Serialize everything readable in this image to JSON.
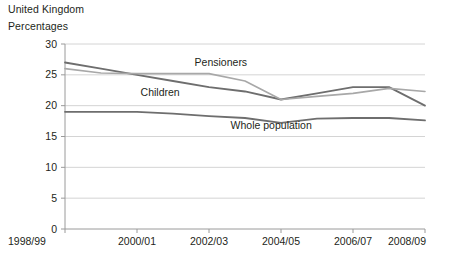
{
  "header": {
    "country": "United Kingdom",
    "units": "Percentages"
  },
  "chart_data": {
    "type": "line",
    "title": "United Kingdom",
    "subtitle": "Percentages",
    "xlabel": "",
    "ylabel": "Percentages",
    "ylim": [
      0,
      30
    ],
    "yticks": [
      0,
      5,
      10,
      15,
      20,
      25,
      30
    ],
    "ytick_labels": [
      "0",
      "5",
      "10",
      "15",
      "20",
      "25",
      "30"
    ],
    "grid": true,
    "grid_axis": "y",
    "legend_position": "inline-labels",
    "x": [
      "1998/99",
      "1999/00",
      "2000/01",
      "2001/02",
      "2002/03",
      "2003/04",
      "2004/05",
      "2005/06",
      "2006/07",
      "2007/08",
      "2008/09"
    ],
    "xtick_labels": [
      "1998/99",
      "2000/01",
      "2002/03",
      "2004/05",
      "2006/07",
      "2008/09"
    ],
    "xtick_indices": [
      0,
      2,
      4,
      6,
      8,
      10
    ],
    "series": [
      {
        "name": "Children",
        "color": "#6e6e6e",
        "width": 1.8,
        "label_x_index": 2.1,
        "label_y": 21.6,
        "values": [
          27.0,
          26.0,
          25.0,
          24.0,
          23.0,
          22.3,
          21.0,
          22.0,
          23.0,
          23.0,
          20.0
        ]
      },
      {
        "name": "Pensioners",
        "color": "#a8a8a8",
        "width": 1.6,
        "label_x_index": 3.6,
        "label_y": 26.4,
        "values": [
          26.0,
          25.3,
          25.2,
          25.2,
          25.2,
          24.0,
          21.0,
          21.5,
          22.0,
          22.8,
          22.3
        ]
      },
      {
        "name": "Whole population",
        "color": "#6e6e6e",
        "width": 1.8,
        "label_x_index": 4.6,
        "label_y": 16.2,
        "values": [
          19.0,
          19.0,
          19.0,
          18.7,
          18.3,
          18.0,
          17.2,
          17.9,
          18.0,
          18.0,
          17.6
        ]
      }
    ]
  }
}
